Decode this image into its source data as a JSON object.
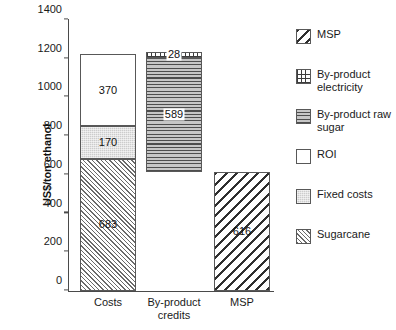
{
  "chart_data": {
    "type": "bar",
    "title": "",
    "subtitle": "",
    "xlabel": "",
    "ylabel": "US$/ton ethanol",
    "ylim": [
      0,
      1400
    ],
    "ytick_step": 200,
    "yticks": [
      0,
      200,
      400,
      600,
      800,
      1000,
      1200,
      1400
    ],
    "ytick_labels": [
      "0",
      "200",
      "400",
      "600",
      "800",
      "1000",
      "1200",
      "1400"
    ],
    "grid": false,
    "stacked": true,
    "legend_position": "right",
    "categories": [
      "Costs",
      "By-product credits",
      "MSP"
    ],
    "series": [
      {
        "name": "MSP",
        "values": [
          0,
          0,
          616
        ]
      },
      {
        "name": "By-product electricity",
        "values": [
          0,
          28,
          0
        ]
      },
      {
        "name": "By-product raw sugar",
        "values": [
          0,
          589,
          0
        ]
      },
      {
        "name": "ROI",
        "values": [
          370,
          0,
          0
        ]
      },
      {
        "name": "Fixed costs",
        "values": [
          170,
          0,
          0
        ]
      },
      {
        "name": "Sugarcane",
        "values": [
          683,
          0,
          0
        ]
      }
    ],
    "bars": [
      {
        "category": "Costs",
        "total": 1223,
        "base": 0,
        "segments": [
          {
            "series": "Sugarcane",
            "value": 683,
            "label": "683",
            "from": 0,
            "to": 683,
            "pattern": "fill-cane",
            "boxed": false
          },
          {
            "series": "Fixed costs",
            "value": 170,
            "label": "170",
            "from": 683,
            "to": 853,
            "pattern": "fill-fixed",
            "boxed": false
          },
          {
            "series": "ROI",
            "value": 370,
            "label": "370",
            "from": 853,
            "to": 1223,
            "pattern": "fill-roi",
            "boxed": false
          }
        ]
      },
      {
        "category": "By-product credits",
        "total": 617,
        "base": 617,
        "segments": [
          {
            "series": "By-product raw sugar",
            "value": 589,
            "label": "589",
            "from": 617,
            "to": 1206,
            "pattern": "fill-rawsugar",
            "boxed": true
          },
          {
            "series": "By-product electricity",
            "value": 28,
            "label": "28",
            "from": 1206,
            "to": 1234,
            "pattern": "fill-elec",
            "boxed": true
          }
        ]
      },
      {
        "category": "MSP",
        "total": 616,
        "base": 0,
        "segments": [
          {
            "series": "MSP",
            "value": 616,
            "label": "616",
            "from": 0,
            "to": 616,
            "pattern": "fill-msp",
            "boxed": false
          }
        ]
      }
    ],
    "annotations": [
      "683",
      "170",
      "370",
      "589",
      "28",
      "616"
    ],
    "colors": {
      "axis": "#4a4a4a",
      "text": "#1a1a1a",
      "roi_fill": "#ffffff",
      "fixed_costs_fill": "#cccccc",
      "raw_sugar_fill": "#bdbdbd",
      "hatch_stroke": "#585858",
      "background": "#ffffff"
    }
  },
  "legend": {
    "items": [
      {
        "label_line1": "MSP",
        "label_line2": "",
        "swatch": "diagonal-hatch-coarse-swatch"
      },
      {
        "label_line1": "By-product",
        "label_line2": "electricity",
        "swatch": "grid-pattern-swatch"
      },
      {
        "label_line1": "By-product raw",
        "label_line2": "sugar",
        "swatch": "horizontal-lines-swatch"
      },
      {
        "label_line1": "ROI",
        "label_line2": "",
        "swatch": "white-fill-swatch"
      },
      {
        "label_line1": "Fixed costs",
        "label_line2": "",
        "swatch": "gray-fill-swatch"
      },
      {
        "label_line1": "Sugarcane",
        "label_line2": "",
        "swatch": "diagonal-hatch-fine-swatch"
      }
    ]
  },
  "axis": {
    "y_title": "US$/ton ethanol",
    "x_categories": [
      {
        "line1": "Costs",
        "line2": ""
      },
      {
        "line1": "By-product",
        "line2": "credits"
      },
      {
        "line1": "MSP",
        "line2": ""
      }
    ]
  }
}
